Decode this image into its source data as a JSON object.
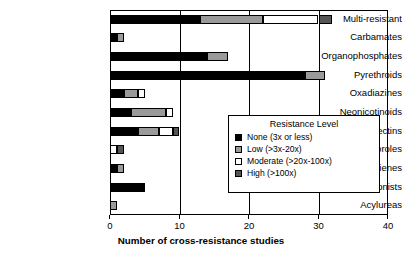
{
  "chart_data": {
    "type": "bar",
    "orientation": "horizontal",
    "stacked": true,
    "title": "",
    "xlabel": "Number of cross-resistance studies",
    "ylabel": "",
    "xlim": [
      0,
      40
    ],
    "xticks": [
      0,
      10,
      20,
      30,
      40
    ],
    "xtick_labels": [
      "0",
      "10",
      "20",
      "30",
      "40"
    ],
    "grid": "vertical",
    "legend_position": "inside-right",
    "legend_title": "Resistance Level",
    "categories": [
      "Multi-resistant",
      "Carbamates",
      "Organophosphates",
      "Pyrethroids",
      "Oxadiazines",
      "Neonicotinoids",
      "Avermectins",
      "Fiproles",
      "Cyclodienes",
      "Ecdysone agonists",
      "Acylureas"
    ],
    "series": [
      {
        "name": "None (3x or less)",
        "key": "none",
        "color": "#000000",
        "values": [
          13,
          1,
          14,
          28,
          2,
          3,
          4,
          0,
          1,
          5,
          0
        ]
      },
      {
        "name": "Low (>3x-20x)",
        "key": "low",
        "color": "#9a9a9a",
        "values": [
          9,
          1,
          3,
          3,
          2,
          5,
          3,
          0,
          1,
          0,
          1
        ]
      },
      {
        "name": "Moderate (>20x-100x)",
        "key": "moderate",
        "color": "#ffffff",
        "values": [
          8,
          0,
          0,
          0,
          1,
          1,
          2,
          1,
          0,
          0,
          0
        ]
      },
      {
        "name": "High (>100x)",
        "key": "high",
        "color": "#555555",
        "values": [
          2,
          0,
          0,
          0,
          0,
          0,
          1,
          1,
          0,
          0,
          0
        ]
      }
    ],
    "totals": [
      32,
      2,
      17,
      31,
      5,
      9,
      10,
      2,
      2,
      5,
      1
    ]
  },
  "legend": {
    "title": "Resistance Level",
    "entries": [
      {
        "label": "None (3x or less)",
        "swatch": "sw-none"
      },
      {
        "label": "Low (>3x-20x)",
        "swatch": "sw-low"
      },
      {
        "label": "Moderate (>20x-100x)",
        "swatch": "sw-moderate"
      },
      {
        "label": "High (>100x)",
        "swatch": "sw-high"
      }
    ]
  },
  "axis": {
    "x_title": "Number of cross-resistance studies"
  }
}
